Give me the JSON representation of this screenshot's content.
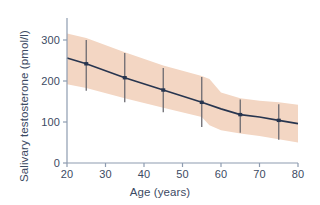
{
  "chart_data": {
    "type": "line",
    "title": "",
    "xlabel": "Age (years)",
    "ylabel": "Salivary testosterone (pmol/l)",
    "xlim": [
      20,
      80
    ],
    "ylim": [
      0,
      320
    ],
    "grid": false,
    "legend": "none",
    "xticks": [
      20,
      30,
      40,
      50,
      60,
      70,
      80
    ],
    "xtick_labels": [
      "20",
      "30",
      "40",
      "50",
      "60",
      "70",
      "80"
    ],
    "yticks": [
      0,
      100,
      200,
      300
    ],
    "ytick_labels": [
      "0",
      "100",
      "200",
      "300"
    ],
    "series": [
      {
        "name": "Mean salivary testosterone",
        "style": "line-with-markers-and-error-bars",
        "color": "#27354f",
        "x": [
          25,
          35,
          45,
          55,
          65,
          75
        ],
        "values": [
          242,
          208,
          178,
          148,
          118,
          104
        ],
        "error_high": [
          300,
          268,
          232,
          210,
          155,
          143
        ],
        "error_low": [
          176,
          148,
          124,
          88,
          74,
          57
        ]
      }
    ],
    "band": {
      "name": "Reference range (shaded)",
      "color": "#f3d6c3",
      "x": [
        20,
        25,
        35,
        45,
        55,
        57,
        60,
        65,
        70,
        75,
        80
      ],
      "upper": [
        316,
        305,
        270,
        238,
        212,
        205,
        172,
        158,
        152,
        148,
        142
      ],
      "lower": [
        192,
        183,
        158,
        135,
        112,
        92,
        80,
        72,
        66,
        58,
        50
      ]
    },
    "trend_line": {
      "x": [
        20,
        25,
        35,
        45,
        55,
        60,
        65,
        70,
        75,
        80
      ],
      "y": [
        256,
        242,
        208,
        178,
        148,
        132,
        118,
        112,
        104,
        96
      ]
    }
  },
  "axes": {
    "y_axis_name": "y-axis",
    "x_axis_name": "x-axis"
  }
}
